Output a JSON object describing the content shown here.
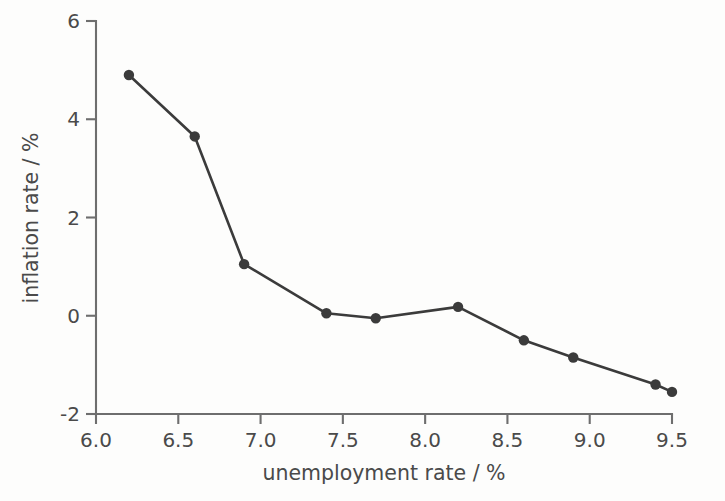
{
  "chart_data": {
    "type": "line",
    "title": "",
    "xlabel": "unemployment rate / %",
    "ylabel": "inflation rate / %",
    "xlim": [
      6.0,
      9.5
    ],
    "ylim": [
      -2,
      6
    ],
    "xticks": [
      "6.0",
      "6.5",
      "7.0",
      "7.5",
      "8.0",
      "8.5",
      "9.0",
      "9.5"
    ],
    "xtick_values": [
      6.0,
      6.5,
      7.0,
      7.5,
      8.0,
      8.5,
      9.0,
      9.5
    ],
    "yticks": [
      "6",
      "4",
      "2",
      "0",
      "-2"
    ],
    "ytick_values": [
      6,
      4,
      2,
      0,
      -2
    ],
    "grid": false,
    "legend": "none",
    "marker": "filled-circle",
    "line_color": "#3b3b3b",
    "marker_color": "#3b3b3b",
    "axis_color": "#6e6e6e",
    "background_color": "#fdfdfc",
    "x": [
      6.2,
      6.6,
      6.9,
      7.4,
      7.7,
      8.2,
      8.6,
      8.9,
      9.4,
      9.5
    ],
    "y": [
      4.9,
      3.65,
      1.05,
      0.05,
      -0.05,
      0.18,
      -0.5,
      -0.85,
      -1.4,
      -1.55
    ],
    "points": [
      {
        "x": 6.2,
        "y": 4.9
      },
      {
        "x": 6.6,
        "y": 3.65
      },
      {
        "x": 6.9,
        "y": 1.05
      },
      {
        "x": 7.4,
        "y": 0.05
      },
      {
        "x": 7.7,
        "y": -0.05
      },
      {
        "x": 8.2,
        "y": 0.18
      },
      {
        "x": 8.6,
        "y": -0.5
      },
      {
        "x": 8.9,
        "y": -0.85
      },
      {
        "x": 9.4,
        "y": -1.4
      },
      {
        "x": 9.5,
        "y": -1.55
      }
    ]
  },
  "axes": {
    "x_title": "unemployment rate / %",
    "y_title": "inflation rate / %",
    "x_tick_labels": [
      "6.0",
      "6.5",
      "7.0",
      "7.5",
      "8.0",
      "8.5",
      "9.0",
      "9.5"
    ],
    "y_tick_labels": [
      "6",
      "4",
      "2",
      "0",
      "-2"
    ]
  }
}
